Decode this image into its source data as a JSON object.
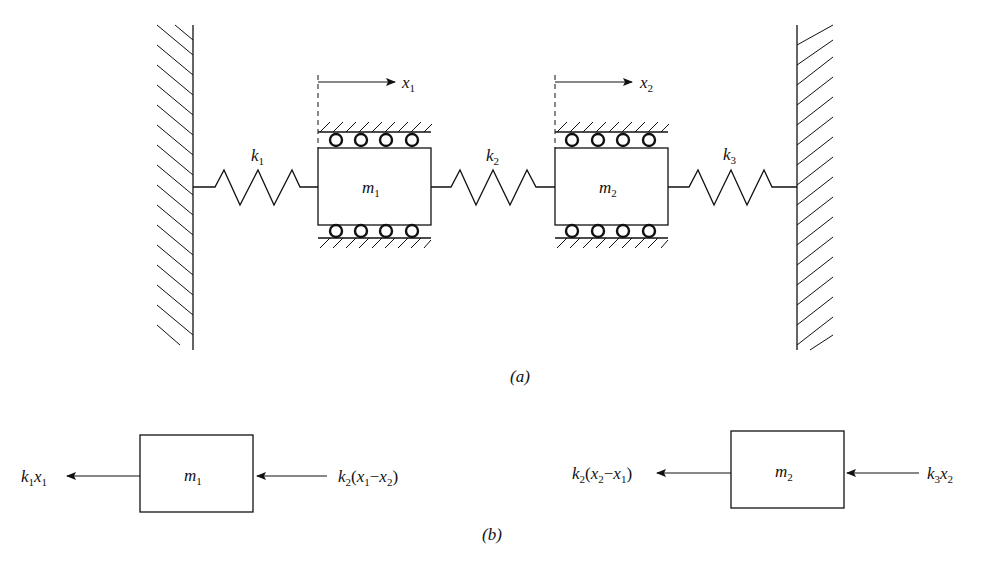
{
  "figure": {
    "part_a": {
      "label": "(a)",
      "masses": [
        {
          "name": "m",
          "sub": "1"
        },
        {
          "name": "m",
          "sub": "2"
        }
      ],
      "springs": [
        {
          "name": "k",
          "sub": "1"
        },
        {
          "name": "k",
          "sub": "2"
        },
        {
          "name": "k",
          "sub": "3"
        }
      ],
      "displacements": [
        {
          "name": "x",
          "sub": "1"
        },
        {
          "name": "x",
          "sub": "2"
        }
      ]
    },
    "part_b": {
      "label": "(b)",
      "fbd_m1": {
        "mass": {
          "name": "m",
          "sub": "1"
        },
        "left_force": {
          "k": "k",
          "ksub": "1",
          "x": "x",
          "xsub": "1"
        },
        "right_force": {
          "k": "k",
          "ksub": "2",
          "open": "(",
          "x1": "x",
          "x1sub": "1",
          "minus": "−",
          "x2": "x",
          "x2sub": "2",
          "close": ")"
        }
      },
      "fbd_m2": {
        "mass": {
          "name": "m",
          "sub": "2"
        },
        "left_force": {
          "k": "k",
          "ksub": "2",
          "open": "(",
          "x1": "x",
          "x1sub": "2",
          "minus": "−",
          "x2": "x",
          "x2sub": "1",
          "close": ")"
        },
        "right_force": {
          "k": "k",
          "ksub": "3",
          "x": "x",
          "xsub": "2"
        }
      }
    },
    "colors": {
      "ink": "#111111",
      "background": "#ffffff"
    }
  }
}
